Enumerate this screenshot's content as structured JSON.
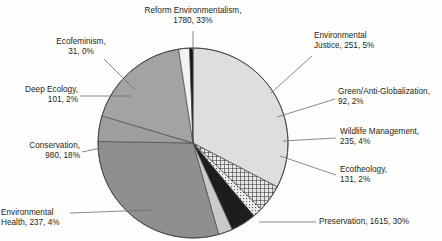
{
  "chart_data": {
    "type": "pie",
    "title": "",
    "total": 5453,
    "start_angle_deg": 0,
    "direction": "clockwise",
    "legend": "none",
    "labels_position": "outside-with-leader-lines",
    "slices": [
      {
        "name": "Reform Environmentalism",
        "value": 1780,
        "percent": "33%",
        "label": "Reform Environmentalism,",
        "label2": "1780, 33%",
        "fill": "#dedede",
        "pattern": "solid"
      },
      {
        "name": "Environmental Justice",
        "value": 251,
        "percent": "5%",
        "label": "Environmental",
        "label2": "Justice, 251, 5%",
        "fill": "#bdbdbd",
        "pattern": "crosshatch"
      },
      {
        "name": "Green/Anti-Globalization",
        "value": 92,
        "percent": "2%",
        "label": "Green/Anti-Globalization,",
        "label2": "92, 2%",
        "fill": "#d6d6d6",
        "pattern": "dots"
      },
      {
        "name": "Wildlife Management",
        "value": 235,
        "percent": "4%",
        "label": "Wildlife Management,",
        "label2": "235, 4%",
        "fill": "#1d1d1d",
        "pattern": "solid"
      },
      {
        "name": "Ecotheology",
        "value": 131,
        "percent": "2%",
        "label": "Ecotheology,",
        "label2": "131, 2%",
        "fill": "#cacaca",
        "pattern": "solid"
      },
      {
        "name": "Preservation",
        "value": 1615,
        "percent": "30%",
        "label": "Preservation, 1615, 30%",
        "label2": "",
        "fill": "#8f8f8f",
        "pattern": "solid"
      },
      {
        "name": "Environmental Health",
        "value": 237,
        "percent": "4%",
        "label": "Environmental",
        "label2": "Health, 237, 4%",
        "fill": "#9e9e9e",
        "pattern": "solid"
      },
      {
        "name": "Conservation",
        "value": 980,
        "percent": "18%",
        "label": "Conservation,",
        "label2": "980, 18%",
        "fill": "#a3a3a3",
        "pattern": "solid"
      },
      {
        "name": "Deep Ecology",
        "value": 101,
        "percent": "2%",
        "label": "Deep Ecology,",
        "label2": "101, 2%",
        "fill": "#f2f2f2",
        "pattern": "solid"
      },
      {
        "name": "Ecofeminism",
        "value": 31,
        "percent": "0%",
        "label": "Ecofeminism,",
        "label2": "31, 0%",
        "fill": "#111111",
        "pattern": "solid"
      }
    ],
    "xlabel": "",
    "ylabel": ""
  },
  "colors": {
    "text": "#231f20",
    "leader_line": "#6d6d6d",
    "outline": "#4a4a4a",
    "background": "#fdfdfc"
  }
}
